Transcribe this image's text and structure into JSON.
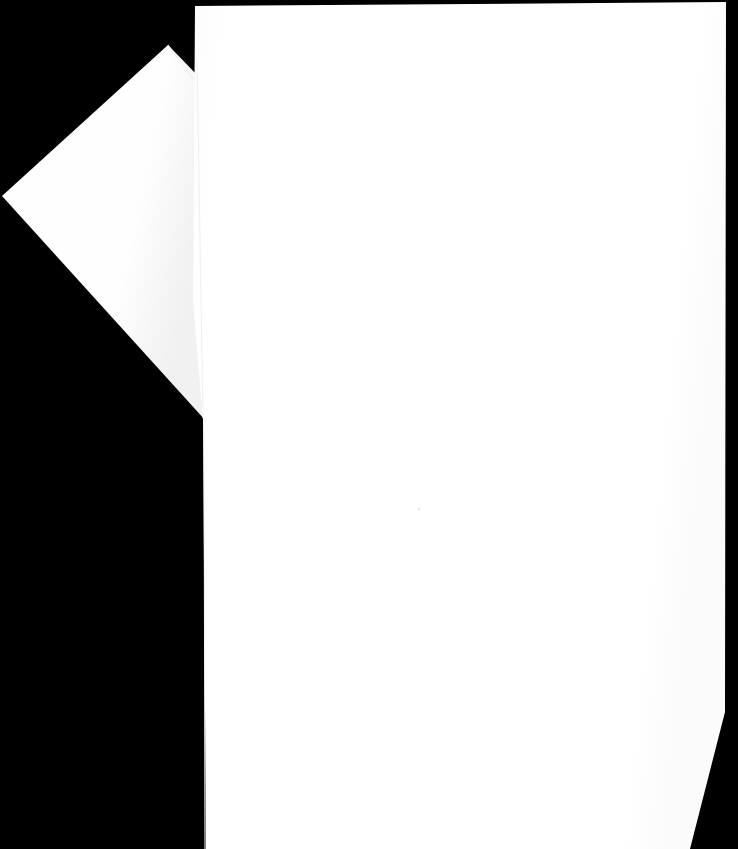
{
  "image": {
    "kind": "scanned-document-photo",
    "width": 738,
    "height": 849,
    "background_color": "#000000",
    "paper_color": "#FFFFFF",
    "description": "Two blank white sheets of paper photographed against a pure black background. No text, headings, or printed marks are visible on either sheet.",
    "visible_text": "",
    "page_number_text": ""
  },
  "sheets": [
    {
      "id": "back-sheet",
      "label": "Back sheet",
      "orientation": "rotated",
      "fill": "#FFFFFF",
      "edge_shade": "#F2F2F2",
      "note": "Tilted sheet tucked behind and to the left of the front sheet; forms a wedge/diamond silhouette.",
      "points": "168,45 200,78 205,420 2,196",
      "crease_points": "168,45 206,96"
    },
    {
      "id": "front-sheet",
      "label": "Front sheet",
      "orientation": "upright",
      "fill": "#FFFFFF",
      "edge_shade": "#FAFAFA",
      "note": "Large near-rectangular sheet filling most of the frame; bottom-right corner is cut at an angle.",
      "points": "195,6 726,2 725,712 690,849 206,849 203,420 193,300"
    }
  ],
  "marks": [
    {
      "id": "speck",
      "label": "Faint speck",
      "x": 419,
      "y": 509,
      "color": "#EDEDED",
      "size": 3
    }
  ],
  "seams": [
    {
      "id": "left-seam",
      "label": "Left edge seam",
      "color": "#F4F4F4",
      "points": "204,420 205,849"
    },
    {
      "id": "overlap-seam",
      "label": "Sheet overlap seam",
      "color": "#F0F0F0",
      "points": "197,60 203,418"
    }
  ]
}
